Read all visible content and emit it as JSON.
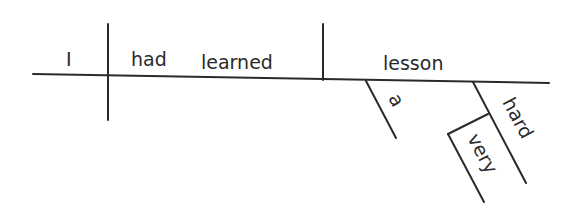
{
  "diagram": {
    "type": "sentence-diagram",
    "sentence": "I had learned a very hard lesson",
    "subject": "I",
    "verb": "had learned",
    "verb_words": [
      "had",
      "learned"
    ],
    "direct_object": "lesson",
    "modifiers": [
      {
        "word": "a",
        "modifies": "lesson",
        "role": "article"
      },
      {
        "word": "hard",
        "modifies": "lesson",
        "role": "adjective"
      },
      {
        "word": "very",
        "modifies": "hard",
        "role": "adverb"
      }
    ],
    "colors": {
      "ink": "#2a2a2a",
      "background": "#ffffff"
    }
  }
}
